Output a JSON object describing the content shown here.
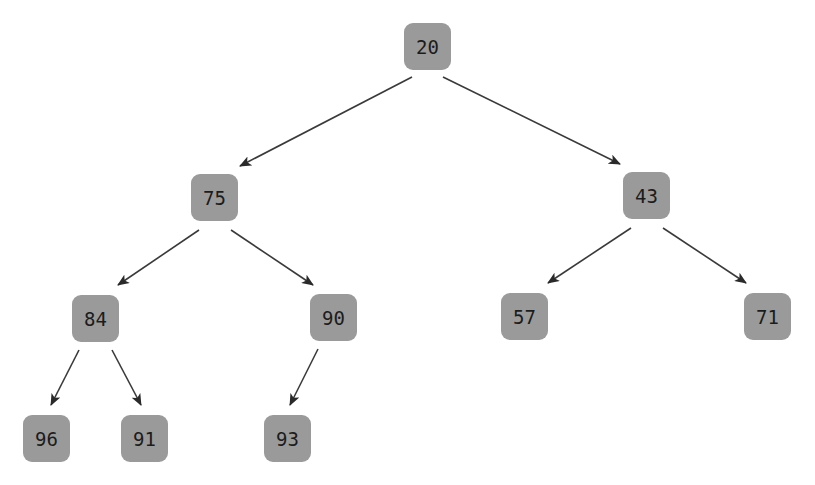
{
  "diagram": {
    "type": "binary-heap-tree",
    "colors": {
      "node_fill": "#9a9a9a",
      "node_text": "#1c1c1c",
      "edge": "#3a3a3a",
      "background": "#ffffff"
    },
    "nodes": [
      {
        "id": "n20",
        "label": "20",
        "x": 404,
        "y": 23
      },
      {
        "id": "n75",
        "label": "75",
        "x": 191,
        "y": 174
      },
      {
        "id": "n43",
        "label": "43",
        "x": 623,
        "y": 172
      },
      {
        "id": "n84",
        "label": "84",
        "x": 72,
        "y": 295
      },
      {
        "id": "n90",
        "label": "90",
        "x": 310,
        "y": 294
      },
      {
        "id": "n57",
        "label": "57",
        "x": 501,
        "y": 293
      },
      {
        "id": "n71",
        "label": "71",
        "x": 744,
        "y": 293
      },
      {
        "id": "n96",
        "label": "96",
        "x": 23,
        "y": 415
      },
      {
        "id": "n91",
        "label": "91",
        "x": 121,
        "y": 415
      },
      {
        "id": "n93",
        "label": "93",
        "x": 264,
        "y": 415
      }
    ],
    "edges": [
      {
        "from": "20",
        "to": "75",
        "x1": 412,
        "y1": 77,
        "x2": 240,
        "y2": 166
      },
      {
        "from": "20",
        "to": "43",
        "x1": 443,
        "y1": 77,
        "x2": 620,
        "y2": 164
      },
      {
        "from": "75",
        "to": "84",
        "x1": 199,
        "y1": 230,
        "x2": 118,
        "y2": 285
      },
      {
        "from": "75",
        "to": "90",
        "x1": 231,
        "y1": 230,
        "x2": 313,
        "y2": 285
      },
      {
        "from": "43",
        "to": "57",
        "x1": 631,
        "y1": 228,
        "x2": 548,
        "y2": 283
      },
      {
        "from": "43",
        "to": "71",
        "x1": 663,
        "y1": 228,
        "x2": 746,
        "y2": 283
      },
      {
        "from": "84",
        "to": "96",
        "x1": 79,
        "y1": 350,
        "x2": 51,
        "y2": 405
      },
      {
        "from": "84",
        "to": "91",
        "x1": 112,
        "y1": 350,
        "x2": 141,
        "y2": 405
      },
      {
        "from": "90",
        "to": "93",
        "x1": 318,
        "y1": 349,
        "x2": 290,
        "y2": 405
      }
    ]
  }
}
